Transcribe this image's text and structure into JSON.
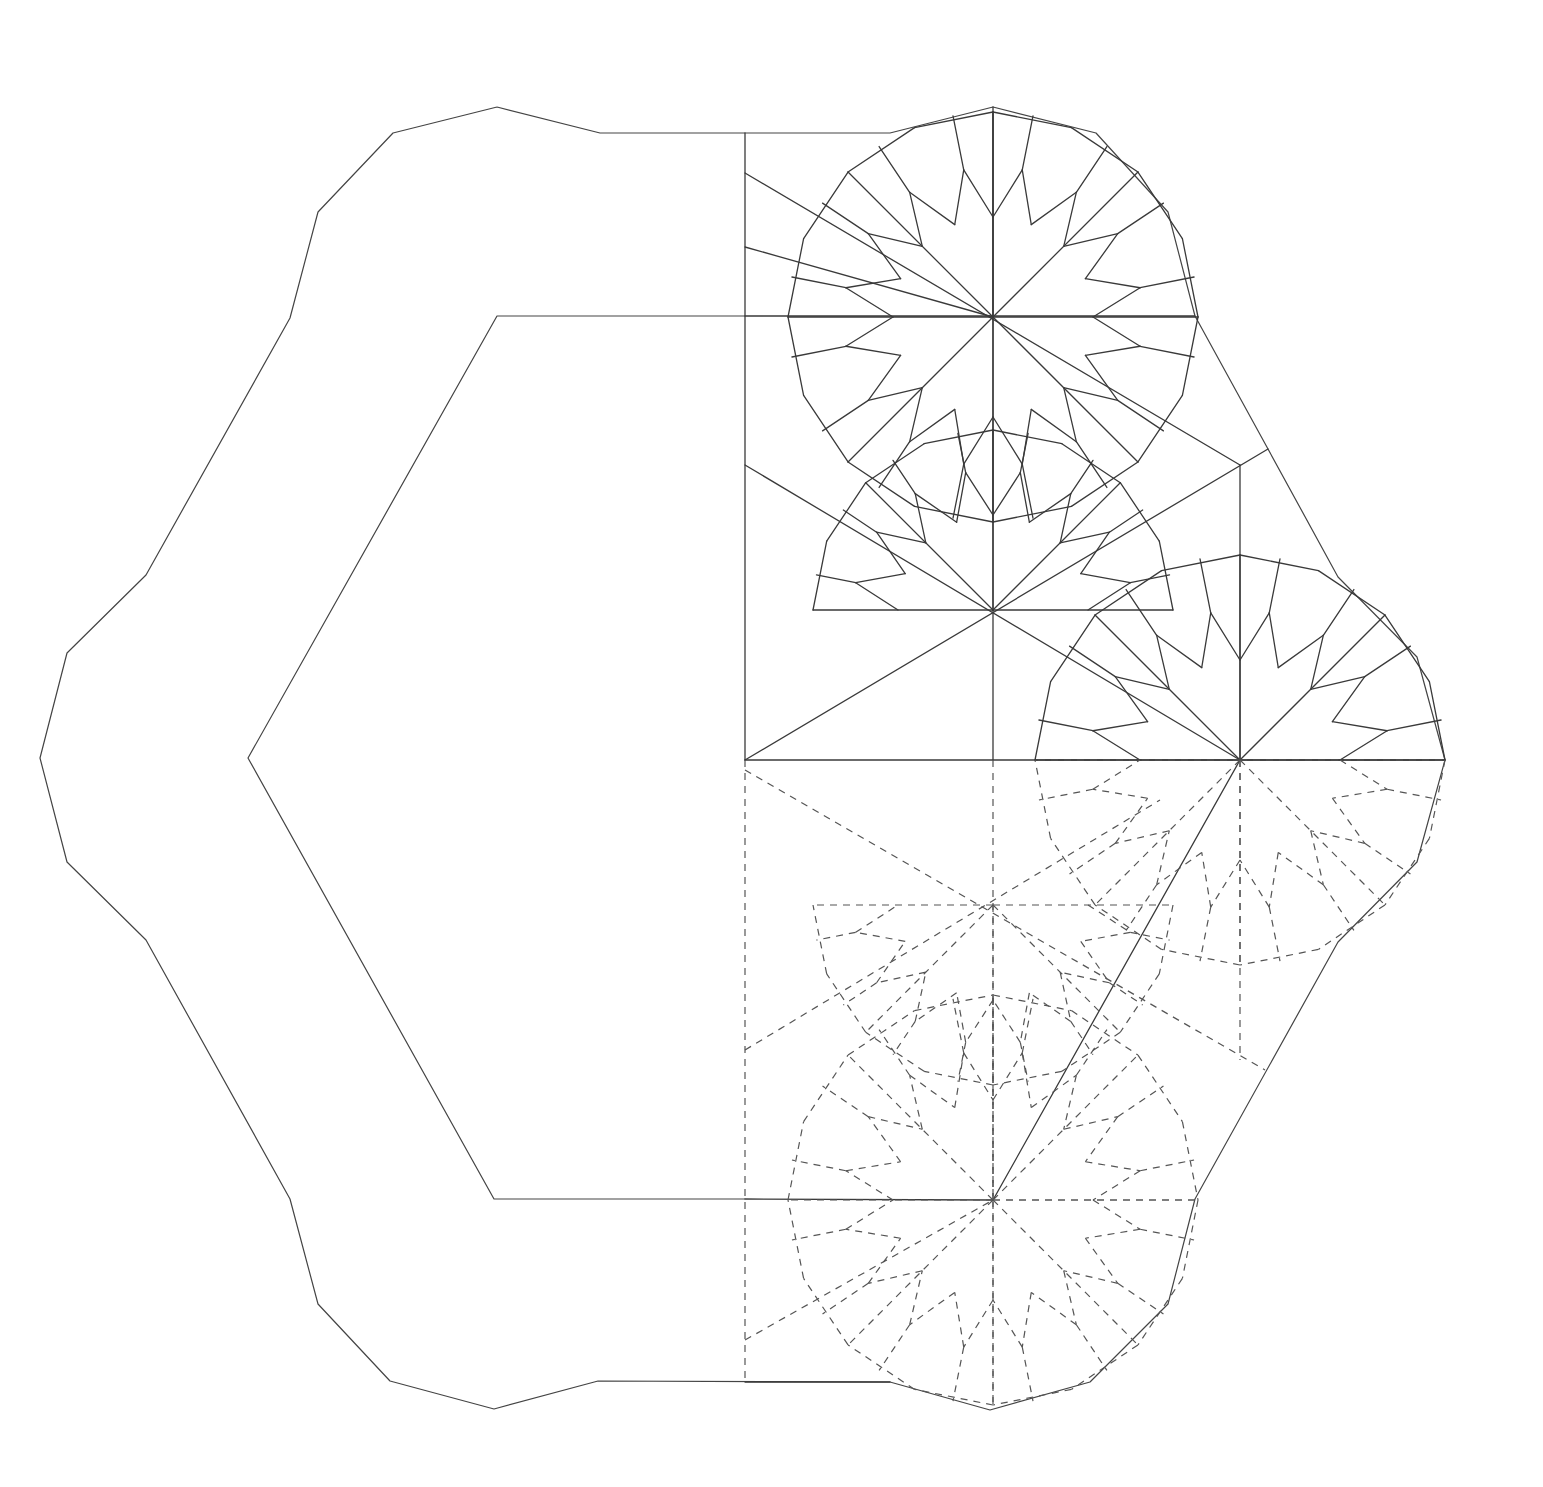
{
  "figure": {
    "type": "crease-pattern-diagram",
    "width": 1543,
    "height": 1487,
    "background": "#ffffff",
    "colors": {
      "mountain": "#3a3a3a",
      "valley": "#555555",
      "outline": "#444444"
    }
  },
  "outer_outline": [
    [
      497,
      107
    ],
    [
      393,
      133
    ],
    [
      318,
      212
    ],
    [
      290,
      318
    ],
    [
      146,
      575
    ],
    [
      67,
      653
    ],
    [
      40,
      758
    ],
    [
      67,
      862
    ],
    [
      146,
      940
    ],
    [
      290,
      1199
    ],
    [
      318,
      1304
    ],
    [
      390,
      1381
    ],
    [
      494,
      1409
    ],
    [
      598,
      1381
    ],
    [
      890,
      1382
    ],
    [
      990,
      1410
    ],
    [
      1090,
      1382
    ],
    [
      1168,
      1304
    ],
    [
      1195,
      1199
    ],
    [
      1338,
      942
    ],
    [
      1417,
      862
    ],
    [
      1445,
      760
    ],
    [
      1417,
      657
    ],
    [
      1338,
      577
    ],
    [
      1268,
      449
    ],
    [
      1195,
      316
    ],
    [
      1168,
      212
    ],
    [
      1096,
      133
    ],
    [
      993,
      107
    ],
    [
      890,
      133
    ],
    [
      600,
      133
    ],
    [
      497,
      107
    ]
  ],
  "inner_hexagon": [
    [
      745,
      316
    ],
    [
      497,
      316
    ],
    [
      248,
      758
    ],
    [
      494,
      1199
    ],
    [
      745,
      1199
    ]
  ],
  "solid_segments": [
    [
      [
        745,
        133
      ],
      [
        745,
        760
      ]
    ],
    [
      [
        745,
        316
      ],
      [
        1195,
        316
      ]
    ],
    [
      [
        745,
        760
      ],
      [
        1445,
        760
      ]
    ],
    [
      [
        993,
        107
      ],
      [
        993,
        760
      ]
    ],
    [
      [
        745,
        760
      ],
      [
        1268,
        449
      ]
    ],
    [
      [
        745,
        465
      ],
      [
        1240,
        760
      ]
    ],
    [
      [
        1240,
        465
      ],
      [
        1240,
        760
      ]
    ],
    [
      [
        1240,
        760
      ],
      [
        993,
        1200
      ]
    ],
    [
      [
        745,
        1199
      ],
      [
        993,
        1200
      ]
    ],
    [
      [
        745,
        1382
      ],
      [
        890,
        1382
      ]
    ],
    [
      [
        745,
        173
      ],
      [
        1240,
        465
      ]
    ],
    [
      [
        745,
        247
      ],
      [
        993,
        317
      ]
    ]
  ],
  "dashed_segments": [
    [
      [
        745,
        760
      ],
      [
        745,
        1382
      ]
    ],
    [
      [
        993,
        760
      ],
      [
        993,
        1410
      ]
    ],
    [
      [
        1240,
        760
      ],
      [
        1240,
        1060
      ]
    ],
    [
      [
        745,
        1050
      ],
      [
        1160,
        800
      ]
    ],
    [
      [
        745,
        770
      ],
      [
        1265,
        1070
      ]
    ],
    [
      [
        745,
        1340
      ],
      [
        993,
        1200
      ]
    ],
    [
      [
        993,
        1200
      ],
      [
        1195,
        1200
      ]
    ]
  ],
  "rosettes": [
    {
      "name": "top-rosette",
      "cx": 993,
      "cy": 317,
      "r_inner": 100,
      "r_mid": 150,
      "r_outer": 205,
      "spokes": 16,
      "style": "solid",
      "start_deg": -90,
      "sweep": 360
    },
    {
      "name": "right-rosette",
      "cx": 1240,
      "cy": 760,
      "r_inner": 100,
      "r_mid": 150,
      "r_outer": 205,
      "spokes": 16,
      "style": "solid",
      "start_deg": 180,
      "sweep": 180
    },
    {
      "name": "right-rosette-lower",
      "cx": 1240,
      "cy": 760,
      "r_inner": 100,
      "r_mid": 150,
      "r_outer": 205,
      "spokes": 16,
      "style": "dashed",
      "start_deg": 0,
      "sweep": 180
    },
    {
      "name": "bottom-rosette",
      "cx": 993,
      "cy": 1200,
      "r_inner": 100,
      "r_mid": 150,
      "r_outer": 205,
      "spokes": 16,
      "style": "dashed",
      "start_deg": -90,
      "sweep": 360
    },
    {
      "name": "center-rosette-upper",
      "cx": 993,
      "cy": 610,
      "r_inner": 95,
      "r_mid": 140,
      "r_outer": 180,
      "spokes": 16,
      "style": "solid",
      "start_deg": 180,
      "sweep": 180
    },
    {
      "name": "center-rosette-lower",
      "cx": 993,
      "cy": 905,
      "r_inner": 95,
      "r_mid": 140,
      "r_outer": 180,
      "spokes": 16,
      "style": "dashed",
      "start_deg": 0,
      "sweep": 180
    }
  ]
}
